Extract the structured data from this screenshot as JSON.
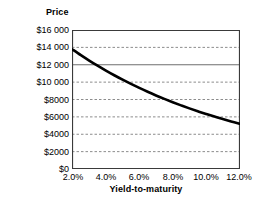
{
  "chart_data": {
    "type": "line",
    "title": "",
    "xlabel": "Yield-to-maturity",
    "ylabel": "Price",
    "xlim": [
      2.0,
      12.0
    ],
    "ylim": [
      0,
      16000
    ],
    "grid": true,
    "legend": "none",
    "x_tick_labels": [
      "2.0%",
      "4.0%",
      "6.0%",
      "8.0%",
      "10.0%",
      "12.0%"
    ],
    "x_tick_values": [
      2.0,
      4.0,
      6.0,
      8.0,
      10.0,
      12.0
    ],
    "y_tick_labels": [
      "$16 000",
      "$14 000",
      "$12 000",
      "$10 000",
      "$8000",
      "$6000",
      "$4000",
      "$2000",
      "$0"
    ],
    "y_tick_values": [
      16000,
      14000,
      12000,
      10000,
      8000,
      6000,
      4000,
      2000,
      0
    ],
    "gridline_styles": {
      "16000": "solid-border",
      "14000": "dashed",
      "12000": "solid",
      "10000": "dashed",
      "8000": "dashed",
      "6000": "dashed",
      "4000": "dashed",
      "2000": "dashed",
      "0": "solid-border"
    },
    "series": [
      {
        "name": "Bond price",
        "color": "#000000",
        "line_width": 2.6,
        "x": [
          2.0,
          2.5,
          3.0,
          3.5,
          4.0,
          4.5,
          5.0,
          5.5,
          6.0,
          6.5,
          7.0,
          7.5,
          8.0,
          8.5,
          9.0,
          9.5,
          10.0,
          10.5,
          11.0,
          11.5,
          12.0
        ],
        "values": [
          13800,
          13180,
          12600,
          12060,
          11560,
          11090,
          10650,
          10240,
          9850,
          9490,
          9150,
          8830,
          8530,
          8250,
          7980,
          7730,
          7490,
          7270,
          7060,
          6860,
          6670
        ]
      }
    ],
    "curve_endpoints": {
      "start": {
        "x": 2.0,
        "y": 13800
      },
      "end": {
        "x": 12.0,
        "y": 5200
      }
    },
    "colors": {
      "background": "#ffffff",
      "axis": "#3a3a3a",
      "gridline": "#8c8c8c",
      "curve": "#000000",
      "text": "#000000"
    }
  }
}
